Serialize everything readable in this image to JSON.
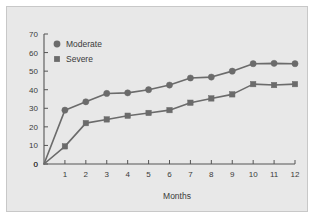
{
  "chart_data": {
    "type": "line",
    "title": "",
    "subtitle": "",
    "xlabel": "Months",
    "ylabel": "",
    "x": [
      0,
      1,
      2,
      3,
      4,
      5,
      6,
      7,
      8,
      9,
      10,
      11,
      12
    ],
    "xlim": [
      0,
      12
    ],
    "ylim": [
      0,
      70
    ],
    "xticks": [
      "0",
      "1",
      "2",
      "3",
      "4",
      "5",
      "6",
      "7",
      "8",
      "9",
      "10",
      "11",
      "12"
    ],
    "yticks": [
      "0",
      "10",
      "20",
      "30",
      "40",
      "50",
      "60",
      "70"
    ],
    "grid": false,
    "legend_position": "top-left",
    "series": [
      {
        "name": "Moderate",
        "marker": "circle",
        "color": "#6b6b6b",
        "values": [
          0,
          29,
          33.5,
          38,
          38.3,
          40,
          42.5,
          46.3,
          46.8,
          50,
          54,
          54.2,
          54
        ]
      },
      {
        "name": "Severe",
        "marker": "square",
        "color": "#6b6b6b",
        "values": [
          0,
          9.5,
          22,
          24,
          26,
          27.5,
          29,
          33,
          35.3,
          37.5,
          43,
          42.5,
          43
        ]
      }
    ],
    "annotations": []
  },
  "figure": {
    "background_color": "#e8e8e8",
    "border_color": "#c8c8c8",
    "axis_color": "#555555",
    "text_color": "#3a3a3a"
  }
}
